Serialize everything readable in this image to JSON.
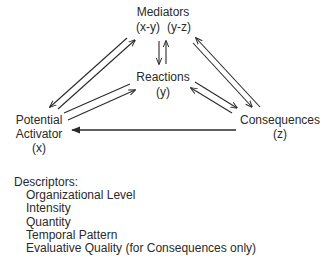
{
  "nodes": {
    "mediators": {
      "title": "Mediators",
      "sub_left": "(x-y)",
      "sub_right": "(y-z)"
    },
    "reactions": {
      "title": "Reactions",
      "sub": "(y)"
    },
    "activator": {
      "line1": "Potential",
      "line2": "Activator",
      "sub": "(x)"
    },
    "consequences": {
      "title": "Consequences",
      "sub": "(z)"
    }
  },
  "edges": [
    {
      "from": "activator",
      "to": "mediators",
      "style": "double-arrow-pair"
    },
    {
      "from": "mediators",
      "to": "reactions",
      "style": "double-arrow-pair"
    },
    {
      "from": "activator",
      "to": "reactions",
      "style": "pair, arrowhead toward reactions"
    },
    {
      "from": "reactions",
      "to": "consequences",
      "style": "double-arrow-pair"
    },
    {
      "from": "mediators",
      "to": "consequences",
      "style": "double-arrow-pair"
    },
    {
      "from": "consequences",
      "to": "activator",
      "style": "single arrow"
    }
  ],
  "descriptors": {
    "heading": "Descriptors:",
    "items": [
      "Organizational Level",
      "Intensity",
      "Quantity",
      "Temporal Pattern",
      "Evaluative Quality (for Consequences only)"
    ]
  },
  "colors": {
    "line": "#2a2a2a",
    "text": "#2a2a2a",
    "background": "#ffffff"
  }
}
